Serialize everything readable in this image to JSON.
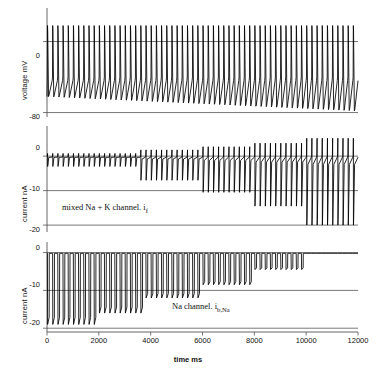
{
  "chart_data": {
    "type": "line",
    "title": "",
    "xlabel": "time ms",
    "xlim": [
      0,
      12000
    ],
    "xticks": [
      0,
      2000,
      4000,
      6000,
      8000,
      10000,
      12000
    ],
    "xticklabels": [
      "0",
      "2000",
      "4000",
      "6000",
      "8000",
      "10000",
      "12000"
    ],
    "grid": false,
    "legend": "none",
    "panels": [
      {
        "id": "voltage-panel",
        "ylabel": "voltage mV",
        "ylim": [
          -85,
          22
        ],
        "yticks": [
          0,
          -80
        ],
        "yticklabels": [
          "0",
          "-80"
        ],
        "annotation": "",
        "description": "Spontaneous pacemaker action potentials, about 60 cycles over 12000 ms, overshoot near +18 mV, maximum diastolic potential drifting from about -62 mV to about -78 mV",
        "series": [
          {
            "name": "membrane potential",
            "spike_count": 60,
            "peak_mV": 18,
            "threshold_mV": -40,
            "max_diastolic_start_mV": -62,
            "max_diastolic_end_mV": -78
          }
        ]
      },
      {
        "id": "if-current-panel",
        "ylabel": "current nA",
        "ylim": [
          -22,
          7
        ],
        "yticks": [
          0,
          -10,
          -20
        ],
        "yticklabels": [
          "0",
          "-10",
          "-20"
        ],
        "annotation": "mixed Na + K channel. i",
        "annotation_sub": "f",
        "description": "Funny current transients growing stepwise in amplitude; downward peaks deepen from about -2.5 nA to about -20 nA while upward transients grow to about +5 nA",
        "steps": [
          {
            "t_start": 0,
            "t_end": 3600,
            "peak_nA": -3.0
          },
          {
            "t_start": 3600,
            "t_end": 5900,
            "peak_nA": -7.0
          },
          {
            "t_start": 5900,
            "t_end": 7900,
            "peak_nA": -10.5
          },
          {
            "t_start": 7900,
            "t_end": 9900,
            "peak_nA": -14.5
          },
          {
            "t_start": 9900,
            "t_end": 12000,
            "peak_nA": -20.0
          }
        ]
      },
      {
        "id": "ibna-current-panel",
        "ylabel": "current nA",
        "ylim": [
          -21,
          2
        ],
        "yticks": [
          0,
          -10,
          -20
        ],
        "yticklabels": [
          "0",
          "-10",
          "-20"
        ],
        "annotation": "Na channel. i",
        "annotation_sub": "b,Na",
        "description": "Background sodium current spikes decaying stepwise from about -19 nA early to about -4 nA near 10000 ms, then flat near zero",
        "steps": [
          {
            "t_start": 0,
            "t_end": 1900,
            "peak_nA": -19.0
          },
          {
            "t_start": 1900,
            "t_end": 3800,
            "peak_nA": -16.0
          },
          {
            "t_start": 3800,
            "t_end": 5900,
            "peak_nA": -12.0
          },
          {
            "t_start": 5900,
            "t_end": 7900,
            "peak_nA": -8.5
          },
          {
            "t_start": 7900,
            "t_end": 10000,
            "peak_nA": -4.5
          },
          {
            "t_start": 10000,
            "t_end": 12000,
            "peak_nA": 0.0
          }
        ]
      }
    ]
  }
}
